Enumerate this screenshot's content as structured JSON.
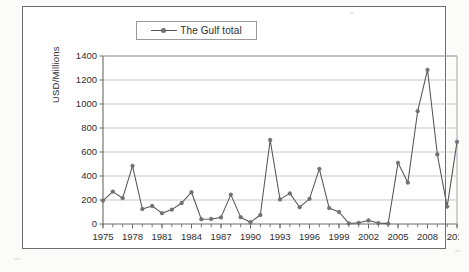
{
  "figure": {
    "legend_label": "The Gulf total",
    "y_axis_title": "USD/Millions"
  },
  "chart_data": {
    "type": "line",
    "title": "",
    "xlabel": "",
    "ylabel": "USD/Millions",
    "ylim": [
      0,
      1400
    ],
    "ytick_step": 200,
    "yticks": [
      0,
      200,
      400,
      600,
      800,
      1000,
      1200,
      1400
    ],
    "ytick_labels": [
      "0",
      "200",
      "400",
      "600",
      "800",
      "1000",
      "1200",
      "1400"
    ],
    "xlim": [
      1975,
      2011
    ],
    "xticks_major": [
      1975,
      1978,
      1981,
      1984,
      1987,
      1990,
      1993,
      1996,
      1999,
      2002,
      2005,
      2008,
      2011
    ],
    "xtick_labels": [
      "1975",
      "1978",
      "1981",
      "1984",
      "1987",
      "1990",
      "1993",
      "1996",
      "1999",
      "2002",
      "2005",
      "2008",
      "2011"
    ],
    "xtick_minor_every": 1,
    "grid": "horizontal",
    "legend_position": "top-center",
    "marker": "dot",
    "line_color": "#55555a",
    "marker_color": "#6f6f74",
    "series": [
      {
        "name": "The Gulf total",
        "x": [
          1975,
          1976,
          1977,
          1978,
          1979,
          1980,
          1981,
          1982,
          1983,
          1984,
          1985,
          1986,
          1987,
          1988,
          1989,
          1990,
          1991,
          1992,
          1993,
          1994,
          1995,
          1996,
          1997,
          1998,
          1999,
          2000,
          2001,
          2002,
          2003,
          2004,
          2005,
          2006,
          2007,
          2008,
          2009,
          2010,
          2011
        ],
        "values": [
          195,
          270,
          215,
          485,
          125,
          150,
          90,
          120,
          175,
          265,
          40,
          42,
          55,
          245,
          57,
          15,
          75,
          700,
          205,
          255,
          140,
          210,
          460,
          133,
          100,
          5,
          10,
          30,
          8,
          3,
          510,
          345,
          940,
          1285,
          580,
          145,
          685
        ]
      }
    ]
  }
}
